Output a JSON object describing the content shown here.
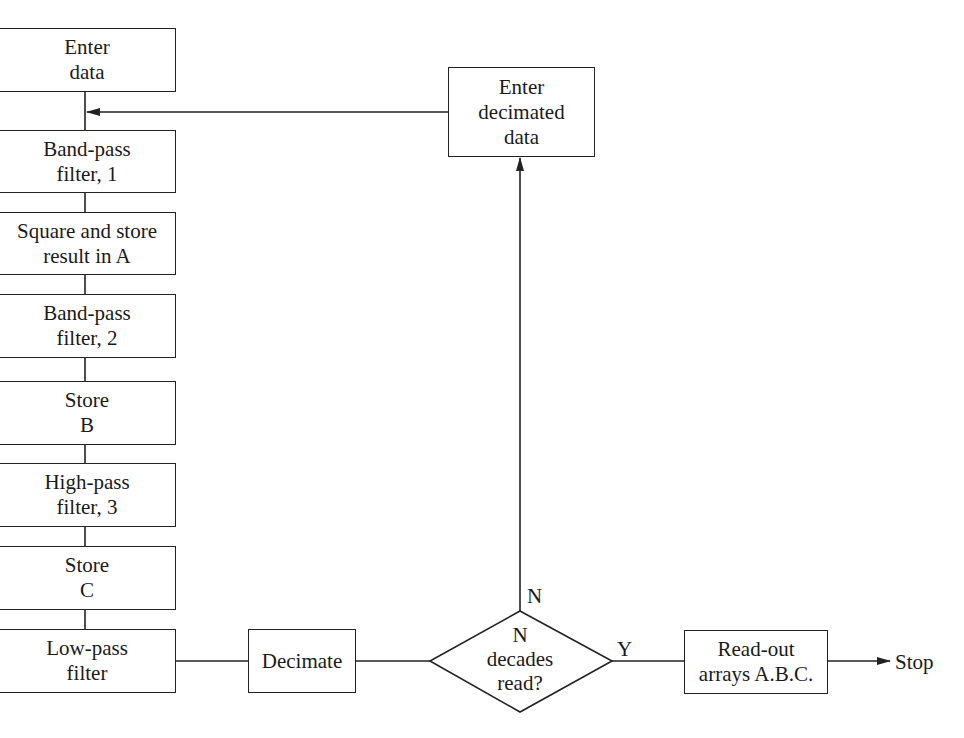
{
  "diagram": {
    "type": "flowchart",
    "left_column": [
      {
        "id": "enter-data",
        "lines": [
          "Enter",
          "data"
        ]
      },
      {
        "id": "band-pass-1",
        "lines": [
          "Band-pass",
          "filter, 1"
        ]
      },
      {
        "id": "square-store-a",
        "lines": [
          "Square and store",
          "result in A"
        ]
      },
      {
        "id": "band-pass-2",
        "lines": [
          "Band-pass",
          "filter, 2"
        ]
      },
      {
        "id": "store-b",
        "lines": [
          "Store",
          "B"
        ]
      },
      {
        "id": "high-pass-3",
        "lines": [
          "High-pass",
          "filter, 3"
        ]
      },
      {
        "id": "store-c",
        "lines": [
          "Store",
          "C"
        ]
      },
      {
        "id": "low-pass",
        "lines": [
          "Low-pass",
          "filter"
        ]
      }
    ],
    "decimate": {
      "lines": [
        "Decimate"
      ]
    },
    "decision": {
      "lines": [
        "N",
        "decades",
        "read?"
      ]
    },
    "enter_decimated": {
      "lines": [
        "Enter",
        "decimated",
        "data"
      ]
    },
    "readout": {
      "lines": [
        "Read-out",
        "arrays A.B.C."
      ]
    },
    "labels": {
      "no_branch": "N",
      "yes_branch": "Y",
      "stop": "Stop"
    },
    "edges": [
      {
        "from": "enter-data",
        "to": "band-pass-1"
      },
      {
        "from": "band-pass-1",
        "to": "square-store-a"
      },
      {
        "from": "square-store-a",
        "to": "band-pass-2"
      },
      {
        "from": "band-pass-2",
        "to": "store-b"
      },
      {
        "from": "store-b",
        "to": "high-pass-3"
      },
      {
        "from": "high-pass-3",
        "to": "store-c"
      },
      {
        "from": "store-c",
        "to": "low-pass"
      },
      {
        "from": "low-pass",
        "to": "decimate"
      },
      {
        "from": "decimate",
        "to": "decision"
      },
      {
        "from": "decision",
        "to": "enter-decimated",
        "label": "N"
      },
      {
        "from": "enter-decimated",
        "to": "band-pass-1 input"
      },
      {
        "from": "decision",
        "to": "readout",
        "label": "Y"
      },
      {
        "from": "readout",
        "to": "stop"
      }
    ]
  }
}
